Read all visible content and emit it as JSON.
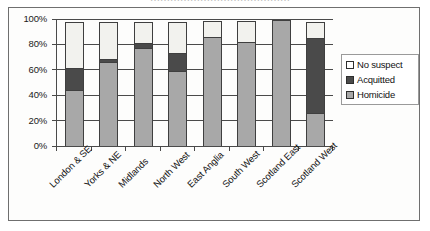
{
  "figure": {
    "caption_sliver": "……………………………………"
  },
  "legend": {
    "position": "right",
    "items": [
      {
        "label": "No suspect",
        "swatch": "white-square-icon",
        "color": "#ffffff"
      },
      {
        "label": "Acquitted",
        "swatch": "dark-square-icon",
        "color": "#4a4a4a"
      },
      {
        "label": "Homicide",
        "swatch": "gray-square-icon",
        "color": "#a8a8a8"
      }
    ]
  },
  "axes": {
    "y_ticks": [
      "0%",
      "20%",
      "40%",
      "60%",
      "80%",
      "100%"
    ],
    "x_labels": [
      "London & SE",
      "Yorks & NE",
      "Midlands",
      "North West",
      "East Anglia",
      "South West",
      "Scotland East",
      "Scotland West"
    ]
  },
  "chart_data": {
    "type": "bar",
    "stacked": true,
    "normalized": "100%",
    "title": "",
    "xlabel": "",
    "ylabel": "",
    "ylim": [
      0,
      100
    ],
    "yticks": [
      0,
      20,
      40,
      60,
      80,
      100
    ],
    "ytick_labels": [
      "0%",
      "20%",
      "40%",
      "60%",
      "80%",
      "100%"
    ],
    "grid": true,
    "legend_position": "right",
    "categories": [
      "London & SE",
      "Yorks & NE",
      "Midlands",
      "North West",
      "East Anglia",
      "South West",
      "Scotland East",
      "Scotland West"
    ],
    "series": [
      {
        "name": "Homicide",
        "color": "#a8a8a8",
        "values": [
          45,
          67,
          78,
          60,
          87,
          83,
          100,
          27
        ]
      },
      {
        "name": "Acquitted",
        "color": "#4a4a4a",
        "values": [
          18,
          3,
          5,
          15,
          0,
          0,
          0,
          60
        ]
      },
      {
        "name": "No suspect",
        "color": "#f2f2ee",
        "values": [
          37,
          30,
          17,
          25,
          13,
          17,
          0,
          13
        ]
      }
    ]
  }
}
